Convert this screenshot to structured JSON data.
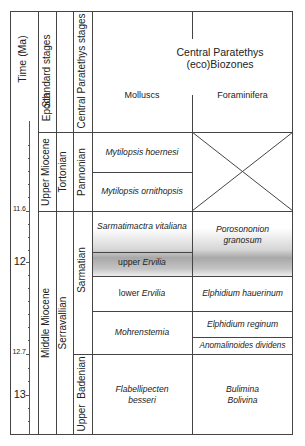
{
  "header": {
    "time": "Time (Ma)",
    "epoch": "Epoch",
    "standard_stages": "Standard stages",
    "central_stages": "Central Paratethys stages",
    "biozones_title_1": "Central Paratethys",
    "biozones_title_2": "(eco)Biozones",
    "molluscs": "Molluscs",
    "foraminifera": "Foraminifera"
  },
  "time_axis": {
    "ticks": [
      {
        "label": "11.6",
        "y": 211,
        "small": true
      },
      {
        "label": "12",
        "y": 262,
        "small": false
      },
      {
        "label": "12.7",
        "y": 354,
        "small": true
      },
      {
        "label": "13",
        "y": 395,
        "small": false
      }
    ]
  },
  "epochs": [
    {
      "label": "Upper Miocene"
    },
    {
      "label": "Middle Miocene"
    }
  ],
  "standard_stages": [
    {
      "label": "Tortonian"
    },
    {
      "label": "Serravallian"
    }
  ],
  "central_stages": [
    {
      "label": "Pannonian"
    },
    {
      "label": "Sarmatian"
    },
    {
      "label": "Upper  Badenian"
    }
  ],
  "molluscs": [
    {
      "label": "Mytilopsis hoernesi"
    },
    {
      "label": "Mytilopsis ornithopsis"
    },
    {
      "label": "Sarmatimactra vitaliana"
    },
    {
      "label_plain": "upper ",
      "label_italic": "Ervilia"
    },
    {
      "label_plain": "lower ",
      "label_italic": "Ervilia"
    },
    {
      "label": "Mohrenstemia"
    },
    {
      "label_1": "Flabellipecten",
      "label_2": "besseri"
    }
  ],
  "foraminifera": [
    {
      "label": "",
      "crossed": true
    },
    {
      "label_1": "Porosononion",
      "label_2": "granosum"
    },
    {
      "label": "Elphidium hauerinum"
    },
    {
      "label": "Elphidium reginum"
    },
    {
      "label": "Anomalinoides dividens"
    },
    {
      "label_1": "Bulimina",
      "label_2": "Bolivina"
    }
  ],
  "colors": {
    "line": "#444444",
    "shade": "#9a9a9a"
  }
}
